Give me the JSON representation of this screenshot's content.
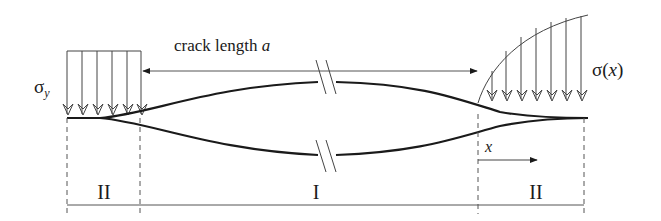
{
  "figure": {
    "type": "crack-cohesive-zone-schematic",
    "colors": {
      "line": "#1a1a1a",
      "thin_line": "#333333",
      "background": "#ffffff"
    },
    "labels": {
      "crack_length_text": "crack length ",
      "crack_length_symbol": "a",
      "sigma_y_base": "σ",
      "sigma_y_sub": "y",
      "sigma_x_base": "σ(",
      "sigma_x_var": "x",
      "sigma_x_close": ")",
      "x_axis": "x",
      "region_left": "II",
      "region_center": "I",
      "region_right": "II"
    },
    "regions": [
      {
        "name": "II",
        "description": "left cohesive zone, uniform stress σy"
      },
      {
        "name": "I",
        "description": "open crack, length a"
      },
      {
        "name": "II",
        "description": "right cohesive zone, stress σ(x)"
      }
    ]
  }
}
